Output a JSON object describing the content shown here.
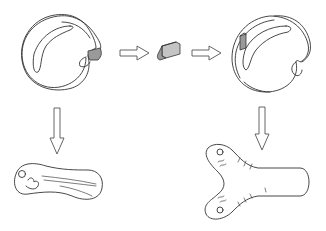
{
  "figure": {
    "type": "schematic-diagram",
    "panels": [
      {
        "id": "donor-embryo",
        "description": "Circular embryo with shaded wedge region at right margin",
        "shaded_region": true
      },
      {
        "id": "excised-tissue",
        "description": "Shaded tissue block removed from donor"
      },
      {
        "id": "host-embryo",
        "description": "Circular embryo with grafted shaded block inserted in left side"
      },
      {
        "id": "donor-result",
        "description": "Elongated single-axis larva/body shape"
      },
      {
        "id": "host-result",
        "description": "Y-shaped forked body with two anterior ends"
      }
    ],
    "arrows": [
      {
        "id": "arrow-donor-to-tissue",
        "direction": "right"
      },
      {
        "id": "arrow-tissue-to-host",
        "direction": "right"
      },
      {
        "id": "arrow-donor-down",
        "direction": "down"
      },
      {
        "id": "arrow-host-down",
        "direction": "down"
      }
    ],
    "colors": {
      "line": "#333333",
      "shade": "#9a9a9a",
      "shade_light": "#c4c4c4",
      "background": "#ffffff"
    }
  }
}
